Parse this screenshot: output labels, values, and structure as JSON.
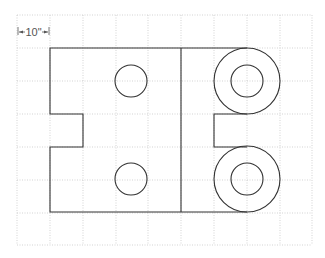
{
  "diagram": {
    "type": "technical-drawing-on-grid",
    "scale_label": "10\"",
    "grid": {
      "cell_size_label": "10\"",
      "columns": 9,
      "rows": 7,
      "line_color": "#c8c8c8",
      "line_style": "dotted"
    },
    "outline_color": "#333333",
    "elements": [
      {
        "name": "main-outline",
        "kind": "polygon",
        "description": "Rectangle with left-side rectangular notch and right side bounded by two rings"
      },
      {
        "name": "divider-line",
        "kind": "line",
        "description": "Vertical divider through the shape"
      },
      {
        "name": "hole-top-left",
        "kind": "circle"
      },
      {
        "name": "hole-bottom-left",
        "kind": "circle"
      },
      {
        "name": "ring-top-outer",
        "kind": "circle"
      },
      {
        "name": "ring-top-inner",
        "kind": "circle"
      },
      {
        "name": "ring-bottom-outer",
        "kind": "circle"
      },
      {
        "name": "ring-bottom-inner",
        "kind": "circle"
      },
      {
        "name": "right-notch",
        "kind": "polyline"
      }
    ]
  }
}
